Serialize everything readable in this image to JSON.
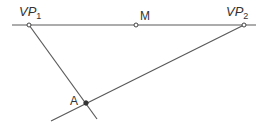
{
  "diagram": {
    "width": 271,
    "height": 126,
    "line_color": "#5a5a5a",
    "point_color": "#444444",
    "label_color": "#333333",
    "horizon": {
      "x1": 12,
      "y1": 25,
      "x2": 256,
      "y2": 25
    },
    "lines": [
      {
        "name": "vp1-to-a-line",
        "x1": 29,
        "y1": 25,
        "x2": 97,
        "y2": 119
      },
      {
        "name": "vp2-to-a-line",
        "x1": 244,
        "y1": 25,
        "x2": 51,
        "y2": 121
      }
    ],
    "points": [
      {
        "id": "VP1",
        "x": 29,
        "y": 25
      },
      {
        "id": "M",
        "x": 136,
        "y": 25
      },
      {
        "id": "VP2",
        "x": 244,
        "y": 25
      },
      {
        "id": "A",
        "x": 86,
        "y": 103
      }
    ]
  },
  "labels": {
    "vp1": {
      "main": "VP",
      "sub": "1"
    },
    "m": {
      "main": "M"
    },
    "vp2": {
      "main": "VP",
      "sub": "2"
    },
    "a": {
      "main": "A"
    }
  }
}
